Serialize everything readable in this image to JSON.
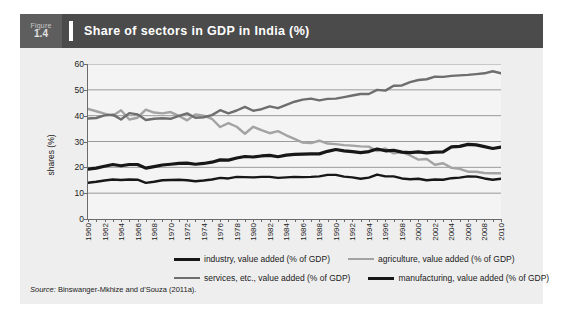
{
  "figure": {
    "word": "Figure",
    "number": "1.4",
    "title": "Share of sectors in GDP in India (%)",
    "header_bg": "#4b4b4b",
    "number_box_bg": "#5e5e5e",
    "panel_bg": "#eeeeee"
  },
  "source": {
    "label": "Source:",
    "text": "Binswanger-Mkhize and d'Souza (2011a)."
  },
  "legend": {
    "rows": [
      [
        {
          "label": "industry, value added (% of GDP)",
          "color": "#171717",
          "width": 3.2
        },
        {
          "label": "agriculture, value added (% of GDP)",
          "color": "#a3a3a3",
          "width": 2.4
        }
      ],
      [
        {
          "label": "services, etc., value added (% of GDP)",
          "color": "#6e6e6e",
          "width": 2.4
        },
        {
          "label": "manufacturing, value added (% of GDP)",
          "color": "#171717",
          "width": 3.2
        }
      ]
    ]
  },
  "chart_data": {
    "type": "line",
    "title": "Share of sectors in GDP in India (%)",
    "xlabel": "",
    "ylabel": "shares (%)",
    "ylim": [
      0,
      60
    ],
    "xlim": [
      1960,
      2010
    ],
    "yticks": [
      0,
      10,
      20,
      30,
      40,
      50,
      60
    ],
    "grid": true,
    "grid_color": "#9a9a9a",
    "legend_position": "below",
    "x": [
      1960,
      1961,
      1962,
      1963,
      1964,
      1965,
      1966,
      1967,
      1968,
      1969,
      1970,
      1971,
      1972,
      1973,
      1974,
      1975,
      1976,
      1977,
      1978,
      1979,
      1980,
      1981,
      1982,
      1983,
      1984,
      1985,
      1986,
      1987,
      1988,
      1989,
      1990,
      1991,
      1992,
      1993,
      1994,
      1995,
      1996,
      1997,
      1998,
      1999,
      2000,
      2001,
      2002,
      2003,
      2004,
      2005,
      2006,
      2007,
      2008,
      2009,
      2010
    ],
    "xtick_labels": [
      "1960",
      "1962",
      "1964",
      "1966",
      "1968",
      "1970",
      "1972",
      "1974",
      "1976",
      "1978",
      "1980",
      "1982",
      "1984",
      "1986",
      "1988",
      "1990",
      "1992",
      "1994",
      "1996",
      "1998",
      "2000",
      "2002",
      "2004",
      "2006",
      "2008",
      "2010"
    ],
    "series": [
      {
        "name": "agriculture, value added (% of GDP)",
        "color": "#a3a3a3",
        "width": 2.4,
        "values": [
          42.6,
          41.7,
          40.8,
          40.0,
          42.1,
          38.5,
          39.2,
          42.3,
          41.2,
          40.9,
          41.4,
          39.9,
          38.2,
          40.5,
          40.0,
          38.8,
          35.6,
          37.1,
          35.7,
          33.0,
          35.7,
          34.4,
          33.2,
          34.0,
          32.4,
          31.0,
          29.6,
          29.4,
          30.3,
          29.2,
          29.0,
          28.6,
          28.4,
          28.1,
          28.0,
          26.3,
          27.3,
          25.4,
          25.9,
          24.6,
          23.0,
          23.2,
          21.0,
          21.6,
          19.8,
          19.4,
          18.3,
          18.3,
          17.8,
          17.7,
          17.7
        ]
      },
      {
        "name": "services, etc., value added (% of GDP)",
        "color": "#6e6e6e",
        "width": 2.4,
        "values": [
          38.9,
          39.1,
          40.1,
          40.4,
          38.5,
          41.0,
          40.5,
          38.3,
          38.8,
          39.0,
          38.8,
          39.9,
          40.9,
          39.2,
          39.4,
          40.2,
          42.1,
          40.9,
          42.0,
          43.4,
          41.9,
          42.5,
          43.6,
          42.9,
          44.2,
          45.4,
          46.2,
          46.6,
          45.9,
          46.5,
          46.6,
          47.2,
          47.8,
          48.4,
          48.4,
          50.0,
          49.7,
          51.6,
          51.7,
          53.0,
          53.8,
          54.1,
          55.1,
          55.0,
          55.4,
          55.6,
          55.8,
          56.1,
          56.4,
          57.2,
          56.4
        ]
      },
      {
        "name": "industry, value added (% of GDP)",
        "color": "#171717",
        "width": 3.2,
        "values": [
          19.3,
          19.7,
          20.4,
          21.1,
          20.6,
          21.1,
          21.1,
          19.7,
          20.3,
          20.9,
          21.2,
          21.5,
          21.6,
          21.2,
          21.5,
          22.0,
          22.9,
          22.8,
          23.6,
          24.2,
          24.0,
          24.4,
          24.6,
          24.1,
          24.7,
          25.0,
          25.1,
          25.2,
          25.2,
          26.2,
          26.9,
          26.4,
          26.1,
          25.7,
          26.1,
          27.1,
          26.4,
          26.6,
          25.9,
          25.7,
          26.0,
          25.6,
          25.9,
          26.0,
          27.9,
          28.1,
          28.9,
          28.7,
          28.0,
          27.3,
          27.8
        ]
      },
      {
        "name": "manufacturing, value added (% of GDP)",
        "color": "#171717",
        "width": 2.4,
        "values": [
          14.0,
          14.4,
          14.9,
          15.3,
          15.1,
          15.3,
          15.2,
          14.0,
          14.4,
          15.0,
          15.1,
          15.2,
          15.0,
          14.6,
          14.9,
          15.3,
          15.9,
          15.7,
          16.3,
          16.2,
          16.1,
          16.3,
          16.3,
          15.9,
          16.1,
          16.3,
          16.2,
          16.3,
          16.5,
          17.1,
          17.1,
          16.4,
          16.1,
          15.6,
          16.0,
          17.2,
          16.5,
          16.5,
          15.7,
          15.4,
          15.6,
          15.0,
          15.3,
          15.2,
          15.8,
          16.0,
          16.5,
          16.4,
          15.7,
          15.2,
          15.6
        ]
      }
    ]
  }
}
